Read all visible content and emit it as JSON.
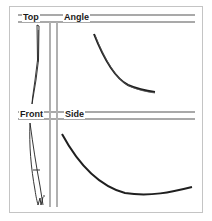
{
  "diagram": {
    "type": "orthographic-views",
    "views": [
      {
        "id": "top",
        "label": "Top"
      },
      {
        "id": "angle",
        "label": "Angle"
      },
      {
        "id": "front",
        "label": "Front"
      },
      {
        "id": "side",
        "label": "Side"
      }
    ],
    "colors": {
      "frame": "#c4c4c4",
      "rule": "#a9a9a9",
      "stroke": "#1f1f1f"
    }
  }
}
